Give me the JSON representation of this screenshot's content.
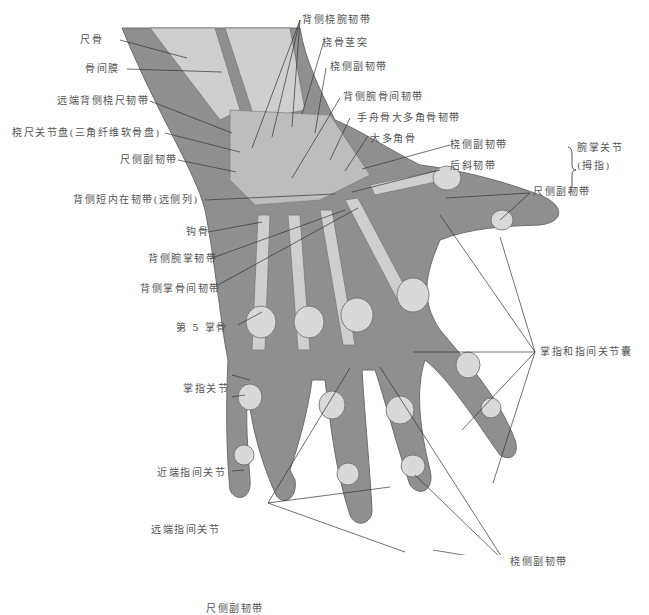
{
  "figure": {
    "colors": {
      "background": "#ffffff",
      "skin": "#8f8f8f",
      "bone": "#cfcfcf",
      "label_text": "#555555",
      "leader_line": "#333333"
    }
  },
  "labels": {
    "ulna": "尺骨",
    "interosseous_membrane": "骨间膜",
    "distal_dorsal_radioulnar_ligament": "远端背侧桡尺韧带",
    "radioulnar_disc": "桡尺关节盘(三角纤维软骨盘)",
    "ulnar_collateral_ligament_wrist": "尺侧副韧带",
    "dorsal_intrinsic_ligament": "背侧短内在韧带(远侧列)",
    "hamate": "钩骨",
    "dorsal_carpometacarpal_ligament": "背侧腕掌韧带",
    "dorsal_metacarpal_ligament": "背侧掌骨间韧带",
    "fifth_metacarpal": "第 5 掌骨",
    "mcp_joint": "掌指关节",
    "pip_joint": "近端指间关节",
    "dip_joint": "远端指间关节",
    "ulnar_collateral_ligaments_fingers": "尺侧副韧带",
    "dorsal_radiocarpal_ligament": "背侧桡腕韧带",
    "radial_styloid": "桡骨茎突",
    "radial_collateral_ligament_wrist": "桡侧副韧带",
    "dorsal_intercarpal_ligament": "背侧腕骨间韧带",
    "scaphotrapezial_ligament": "手舟骨大多角骨韧带",
    "trapezium": "大多角骨",
    "radial_collateral_ligament_cmc": "桡侧副韧带",
    "posterior_oblique_ligament": "后斜韧带",
    "cmc_joint_thumb_line1": "腕掌关节",
    "cmc_joint_thumb_line2": "(拇指)",
    "ulnar_collateral_ligament_thumb": "尺侧副韧带",
    "joint_capsules": "掌指和指间关节囊",
    "radial_collateral_ligaments_fingers": "桡侧副韧带"
  }
}
